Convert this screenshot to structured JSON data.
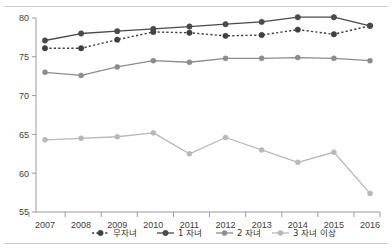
{
  "chart_data": {
    "type": "line",
    "title": "",
    "subtitle": "",
    "xlabel": "",
    "ylabel": "",
    "categories": [
      "2007",
      "2008",
      "2009",
      "2010",
      "2011",
      "2012",
      "2013",
      "2014",
      "2015",
      "2016"
    ],
    "ylim": [
      55,
      80
    ],
    "yticks": [
      55,
      60,
      65,
      70,
      75,
      80
    ],
    "ytick_labels": [
      "55",
      "60",
      "65",
      "70",
      "75",
      "80"
    ],
    "grid": false,
    "legend_position": "bottom",
    "series": [
      {
        "name": "무자녀",
        "style": "dotted",
        "color": "#3f3f3f",
        "marker": "circle",
        "values": [
          76.1,
          76.1,
          77.2,
          78.2,
          78.1,
          77.7,
          77.8,
          78.5,
          77.9,
          79.0
        ]
      },
      {
        "name": "1 자녀",
        "style": "solid",
        "color": "#4a4a4a",
        "marker": "circle",
        "values": [
          77.1,
          78.0,
          78.3,
          78.6,
          78.9,
          79.2,
          79.5,
          80.1,
          80.1,
          79.0
        ]
      },
      {
        "name": "2 자녀",
        "style": "solid",
        "color": "#8c8c8c",
        "marker": "circle",
        "values": [
          73.0,
          72.6,
          73.7,
          74.5,
          74.3,
          74.8,
          74.8,
          74.9,
          74.8,
          74.5
        ]
      },
      {
        "name": "3 자녀 이상",
        "style": "solid",
        "color": "#b8b8b8",
        "marker": "circle",
        "values": [
          64.3,
          64.5,
          64.7,
          65.2,
          62.5,
          64.6,
          63.0,
          61.4,
          62.7,
          57.4
        ]
      }
    ]
  },
  "legend": {
    "items": [
      {
        "label": "무자녀"
      },
      {
        "label": "1 자녀"
      },
      {
        "label": "2 자녀"
      },
      {
        "label": "3 자녀 이상"
      }
    ]
  }
}
